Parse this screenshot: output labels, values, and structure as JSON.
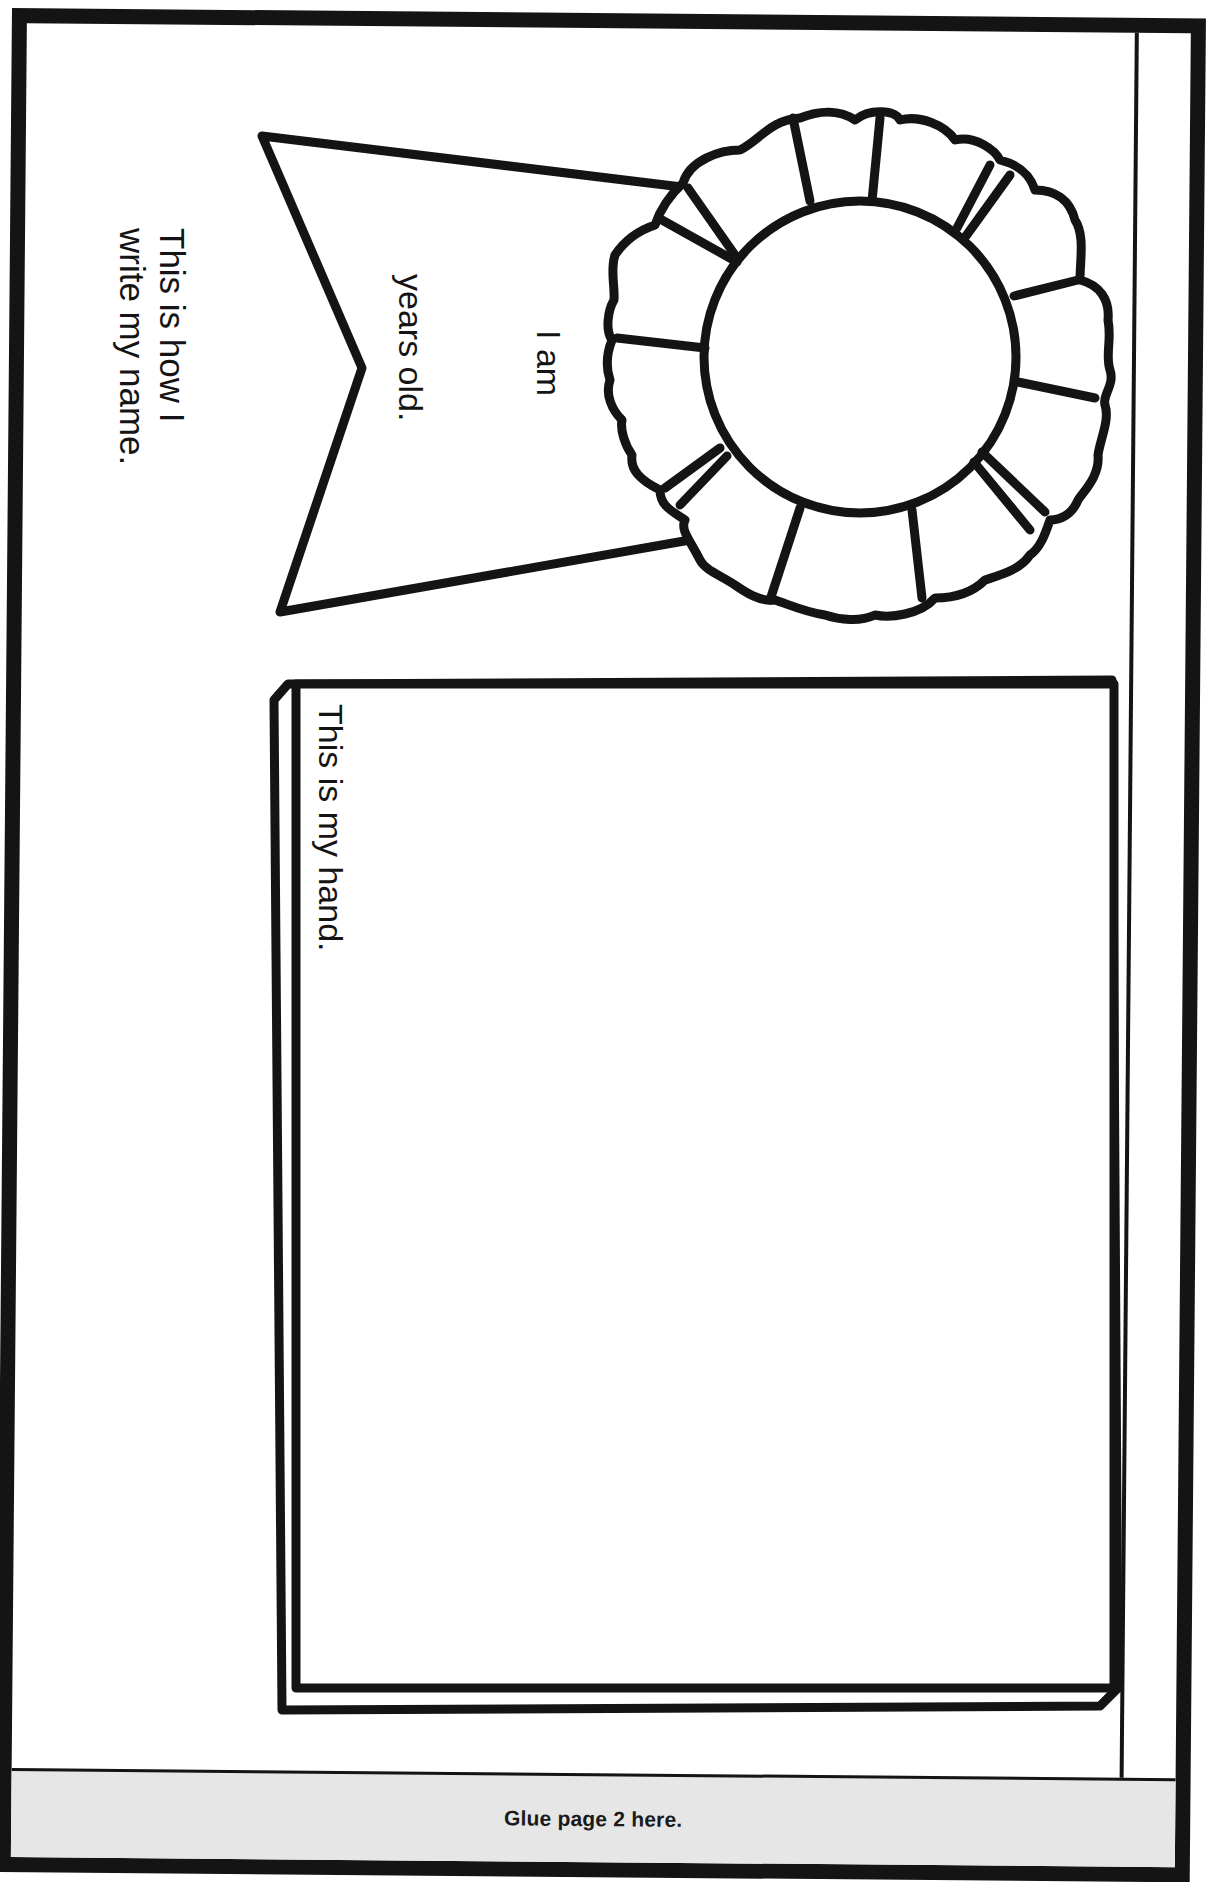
{
  "worksheet": {
    "name_prompt": {
      "line1": "This is how I",
      "line2": "write my name."
    },
    "ribbon": {
      "line1": "I am",
      "line2": "years old."
    },
    "hand_box": {
      "label": "This is my hand."
    },
    "footer": {
      "glue_label": "Glue page 2 here."
    }
  },
  "colors": {
    "ink": "#141414",
    "paper": "#ffffff",
    "glue_strip": "#e6e6e6"
  }
}
